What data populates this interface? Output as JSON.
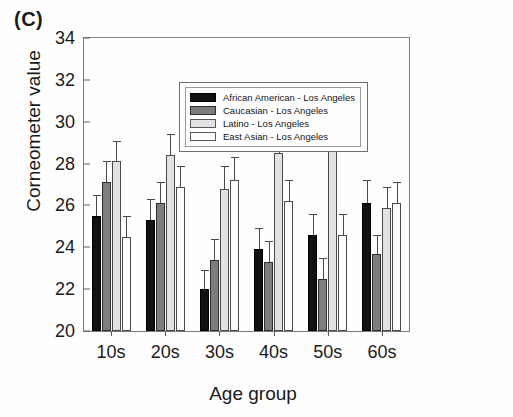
{
  "panel_label": "(C)",
  "chart_data": {
    "type": "bar",
    "title": "",
    "subtitle": "",
    "xlabel": "Age group",
    "ylabel": "Corneometer value",
    "categories": [
      "10s",
      "20s",
      "30s",
      "40s",
      "50s",
      "60s"
    ],
    "ylim": [
      20,
      34
    ],
    "ytick_step": 2,
    "yticks": [
      20,
      22,
      24,
      26,
      28,
      30,
      32,
      34
    ],
    "grid": false,
    "legend_position": "top-left-inside",
    "error_bars": "upper-only",
    "series": [
      {
        "name": "African American - Los Angeles",
        "color": "#111111",
        "values": [
          25.5,
          25.3,
          22.0,
          23.9,
          24.6,
          26.1
        ],
        "errors": [
          1.0,
          1.0,
          0.9,
          1.0,
          1.0,
          1.1
        ]
      },
      {
        "name": "Caucasian - Los Angeles",
        "color": "#7d7d7d",
        "values": [
          27.1,
          26.1,
          23.4,
          23.3,
          22.5,
          23.7
        ],
        "errors": [
          1.0,
          1.0,
          1.0,
          1.0,
          1.0,
          0.9
        ]
      },
      {
        "name": "Latino - Los Angeles",
        "color": "#e2e2e2",
        "values": [
          28.1,
          28.4,
          26.8,
          28.5,
          30.1,
          25.9
        ],
        "errors": [
          1.0,
          1.0,
          1.1,
          1.0,
          1.1,
          1.0
        ]
      },
      {
        "name": "East Asian - Los Angeles",
        "color": "#fdfdfd",
        "values": [
          24.5,
          26.9,
          27.2,
          26.2,
          24.6,
          26.1
        ],
        "errors": [
          1.0,
          1.0,
          1.1,
          1.0,
          1.0,
          1.0
        ]
      }
    ]
  }
}
